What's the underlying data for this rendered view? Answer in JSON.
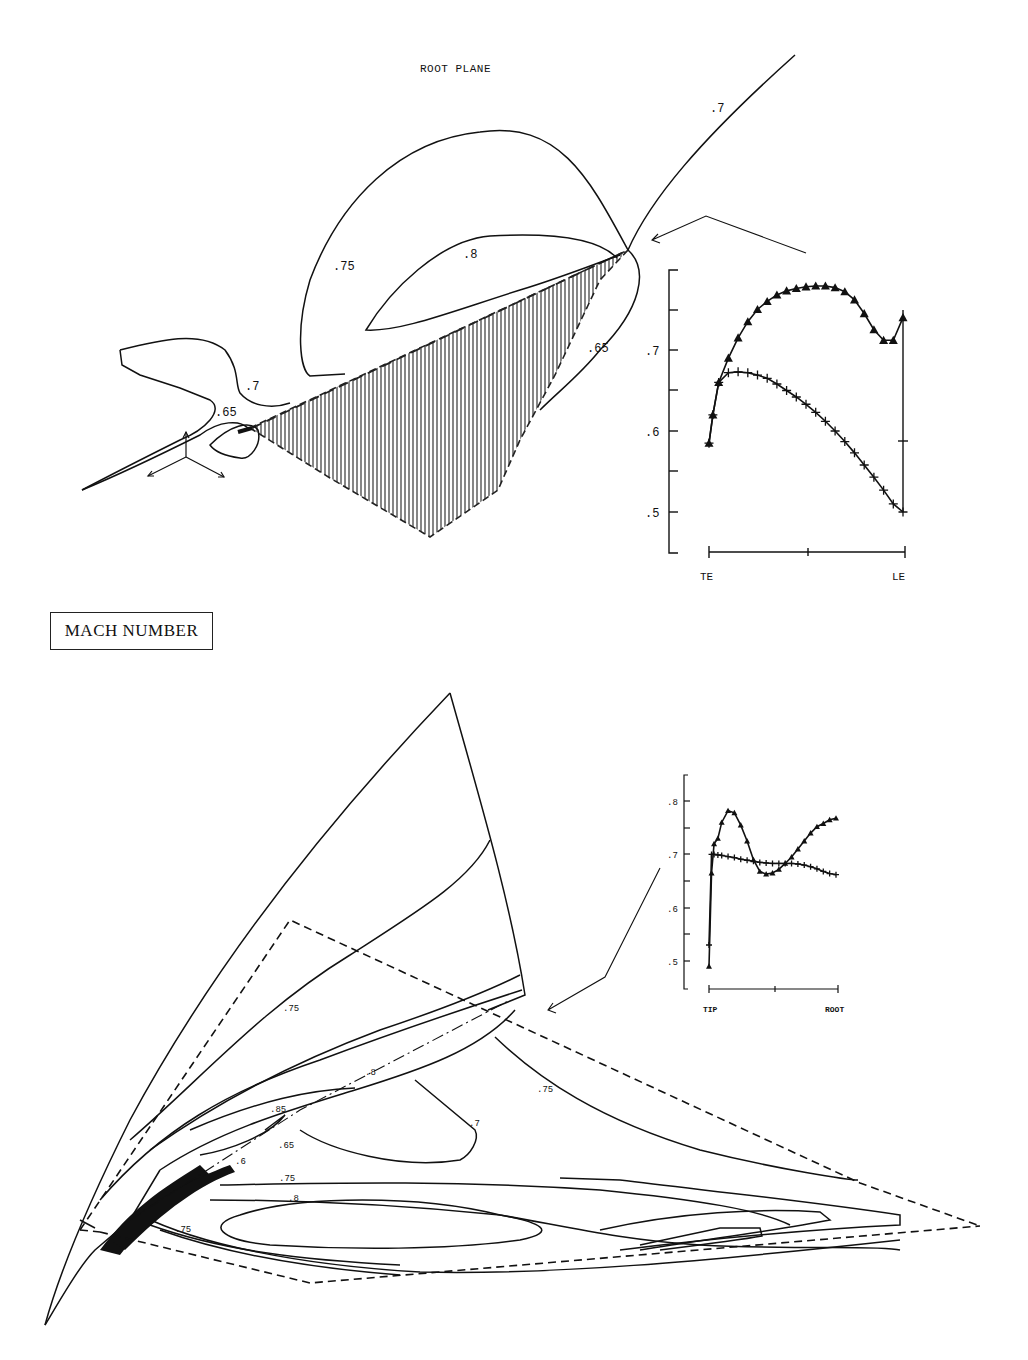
{
  "page": {
    "top_title": "ROOT PLANE",
    "section_label": "MACH NUMBER"
  },
  "top_plot": {
    "contour_labels": [
      ".7",
      ".75",
      ".8",
      ".65",
      ".7",
      ".65"
    ],
    "hatched_region": "root-plane section (hatched)"
  },
  "bottom_plot": {
    "contour_labels": [
      ".75",
      ".8",
      ".85",
      ".65",
      ".6",
      ".75",
      ".8",
      ".75",
      ".75",
      ".7"
    ]
  },
  "chart_data": [
    {
      "type": "line",
      "title": "Root plane Mach distribution",
      "xlabel_left": "TE",
      "xlabel_right": "LE",
      "ylabel": "Mach number",
      "yticks": [
        ".5",
        ".6",
        ".7"
      ],
      "ylim": [
        0.45,
        0.8
      ],
      "x": [
        0.0,
        0.02,
        0.05,
        0.1,
        0.15,
        0.2,
        0.25,
        0.3,
        0.35,
        0.4,
        0.45,
        0.5,
        0.55,
        0.6,
        0.65,
        0.7,
        0.75,
        0.8,
        0.85,
        0.9,
        0.95,
        1.0
      ],
      "series": [
        {
          "name": "triangle markers (upper)",
          "marker": "triangle",
          "values": [
            0.585,
            0.62,
            0.66,
            0.69,
            0.715,
            0.735,
            0.75,
            0.76,
            0.768,
            0.773,
            0.776,
            0.778,
            0.779,
            0.779,
            0.777,
            0.772,
            0.762,
            0.745,
            0.725,
            0.712,
            0.712,
            0.74
          ]
        },
        {
          "name": "plus markers (lower)",
          "marker": "plus",
          "values": [
            0.585,
            0.62,
            0.66,
            0.672,
            0.673,
            0.672,
            0.669,
            0.665,
            0.658,
            0.65,
            0.642,
            0.633,
            0.623,
            0.612,
            0.6,
            0.587,
            0.573,
            0.558,
            0.543,
            0.527,
            0.51,
            0.5
          ]
        }
      ]
    },
    {
      "type": "line",
      "title": "Spanwise Mach distribution",
      "xlabel_left": "TIP",
      "xlabel_right": "ROOT",
      "ylabel": "Mach number",
      "yticks": [
        ".5",
        ".6",
        ".7",
        ".8"
      ],
      "ylim": [
        0.45,
        0.85
      ],
      "x": [
        0.0,
        0.02,
        0.04,
        0.07,
        0.1,
        0.15,
        0.2,
        0.25,
        0.3,
        0.35,
        0.4,
        0.45,
        0.5,
        0.55,
        0.6,
        0.65,
        0.7,
        0.75,
        0.8,
        0.85,
        0.9,
        0.95,
        1.0
      ],
      "series": [
        {
          "name": "triangle markers",
          "marker": "triangle",
          "values": [
            0.49,
            0.665,
            0.72,
            0.73,
            0.76,
            0.782,
            0.778,
            0.755,
            0.725,
            0.69,
            0.668,
            0.663,
            0.665,
            0.672,
            0.683,
            0.695,
            0.71,
            0.725,
            0.74,
            0.752,
            0.758,
            0.765,
            0.768
          ]
        },
        {
          "name": "plus markers",
          "marker": "plus",
          "values": [
            0.53,
            0.7,
            0.7,
            0.699,
            0.698,
            0.696,
            0.694,
            0.691,
            0.689,
            0.687,
            0.685,
            0.684,
            0.683,
            0.683,
            0.683,
            0.683,
            0.682,
            0.68,
            0.677,
            0.673,
            0.668,
            0.664,
            0.662
          ]
        }
      ]
    }
  ]
}
